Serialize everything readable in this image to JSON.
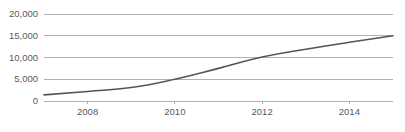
{
  "chart_data": {
    "type": "line",
    "title": "",
    "subtitle": "",
    "xlabel": "",
    "ylabel": "",
    "x": [
      2007,
      2008,
      2009,
      2010,
      2011,
      2012,
      2013,
      2014,
      2015
    ],
    "series": [
      {
        "name": "",
        "values": [
          1400,
          2200,
          3100,
          5000,
          7500,
          10100,
          11900,
          13500,
          15000
        ]
      }
    ],
    "xlim": [
      2007,
      2015
    ],
    "ylim": [
      0,
      20000
    ],
    "y_ticks": [
      0,
      5000,
      10000,
      15000,
      20000
    ],
    "y_tick_labels": [
      "0",
      "5,000",
      "10,000",
      "15,000",
      "20,000"
    ],
    "x_ticks": [
      2008,
      2010,
      2012,
      2014
    ],
    "x_tick_labels": [
      "2008",
      "2010",
      "2012",
      "2014"
    ],
    "grid": true,
    "grid_axis": "y",
    "legend": false,
    "legend_position": "none",
    "colors": {
      "line": "#555557",
      "grid": "#a9a9ac",
      "axis": "#a9a9ac",
      "text": "#58585a",
      "background": "#ffffff"
    }
  }
}
